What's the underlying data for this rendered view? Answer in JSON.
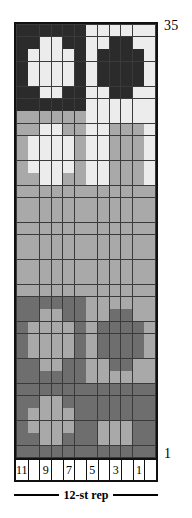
{
  "chart_data": {
    "type": "heatmap",
    "title": "",
    "xlabel": "12-st rep",
    "ylabel": "",
    "columns": 12,
    "rows": 35,
    "x_tick_labels": [
      "11",
      "",
      "9",
      "",
      "7",
      "",
      "5",
      "",
      "3",
      "",
      "1",
      ""
    ],
    "column_numbers_right_to_left": [
      1,
      2,
      3,
      4,
      5,
      6,
      7,
      8,
      9,
      10,
      11,
      12
    ],
    "row_tick_labels": {
      "top": "35",
      "bottom": "1"
    },
    "legend_position": "none",
    "grid": true,
    "palette": {
      "K": "#2b2b2b",
      "W": "#ececec",
      "G": "#a9a9a9",
      "D": "#6e6e6e"
    },
    "symbol_names": {
      "K": "black-stitch",
      "W": "white-stitch",
      "G": "gray-stitch",
      "D": "dark-gray-stitch"
    },
    "rows_top_to_bottom": [
      "KKKKKKWWWWWW",
      "KKWWKKWWKKWW",
      "KWWWWKWKKKKW",
      "KWWWWKWKKKKW",
      "KWWWWKWKKKKW",
      "KKWWKKWWKKWW",
      "KKKKKKWWWWWW",
      "GGGGGGWWWWWW",
      "GGWWGGWWGGGW",
      "GWWWWGWWGGGW",
      "GWWWWGWWGGGW",
      "GWWWWGWWGGGW",
      "GGWWGGWWGGGW",
      "GGGGGGGGGGGG",
      "GGGGGGGGGGGG",
      "GGGGGGGGGGGG",
      "GGGGGGGGGGGG",
      "GGGGGGGGGGGG",
      "GGGGGGGGGGGG",
      "GGGGGGGGGGGG",
      "GGGGGGGGGGGG",
      "GGGGGGGGGGGG",
      "DDDDDDGGGGGG",
      "DDGGDDGGDDGG",
      "DGGGGDGDDDDG",
      "DGGGGDGDDDDG",
      "DGGGGDGDDDDG",
      "DDGGDDGGDDGG",
      "DDDDDDGGGGGG",
      "DDDDDDDDDDDD",
      "DDGGDDDDDDDD",
      "DGGGGDDDDDDD",
      "DGGGGDDGGGDD",
      "DDGGDDDGGGDD",
      "DDDDDDDDDDDD"
    ]
  },
  "axis": {
    "top_row_number": "35",
    "bottom_row_number": "1",
    "stitch_numbers": [
      "11",
      "",
      "9",
      "",
      "7",
      "",
      "5",
      "",
      "3",
      "",
      "1",
      ""
    ],
    "repeat_label": "12-st rep"
  }
}
